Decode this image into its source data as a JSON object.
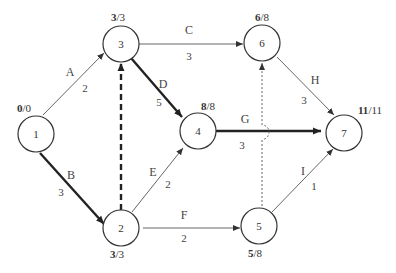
{
  "diagram": {
    "type": "activity-on-arrow network",
    "nodes": [
      {
        "id": "1",
        "label": "1",
        "time_early": "0",
        "time_late": "0"
      },
      {
        "id": "2",
        "label": "2",
        "time_early": "3",
        "time_late": "3"
      },
      {
        "id": "3",
        "label": "3",
        "time_early": "3",
        "time_late": "3"
      },
      {
        "id": "4",
        "label": "4",
        "time_early": "8",
        "time_late": "8"
      },
      {
        "id": "5",
        "label": "5",
        "time_early": "5",
        "time_late": "8"
      },
      {
        "id": "6",
        "label": "6",
        "time_early": "6",
        "time_late": "8"
      },
      {
        "id": "7",
        "label": "7",
        "time_early": "11",
        "time_late": "11"
      }
    ],
    "edges": [
      {
        "id": "A",
        "from": "1",
        "to": "3",
        "activity": "A",
        "duration": "2",
        "style": "thin"
      },
      {
        "id": "B",
        "from": "1",
        "to": "2",
        "activity": "B",
        "duration": "3",
        "style": "critical"
      },
      {
        "id": "C",
        "from": "3",
        "to": "6",
        "activity": "C",
        "duration": "3",
        "style": "thin"
      },
      {
        "id": "D",
        "from": "3",
        "to": "4",
        "activity": "D",
        "duration": "5",
        "style": "critical"
      },
      {
        "id": "E",
        "from": "2",
        "to": "4",
        "activity": "E",
        "duration": "2",
        "style": "thin"
      },
      {
        "id": "F",
        "from": "2",
        "to": "5",
        "activity": "F",
        "duration": "2",
        "style": "thin"
      },
      {
        "id": "G",
        "from": "4",
        "to": "7",
        "activity": "G",
        "duration": "3",
        "style": "critical"
      },
      {
        "id": "H",
        "from": "6",
        "to": "7",
        "activity": "H",
        "duration": "3",
        "style": "thin"
      },
      {
        "id": "I",
        "from": "5",
        "to": "7",
        "activity": "I",
        "duration": "1",
        "style": "thin"
      },
      {
        "id": "dummy-2-3",
        "from": "2",
        "to": "3",
        "activity": "",
        "duration": "",
        "style": "dummy-critical"
      },
      {
        "id": "dummy-5-6",
        "from": "5",
        "to": "6",
        "activity": "",
        "duration": "",
        "style": "dummy"
      }
    ]
  }
}
